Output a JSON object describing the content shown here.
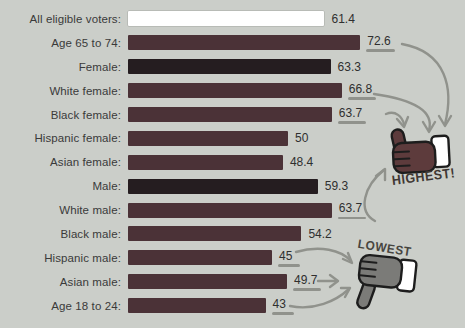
{
  "chart_data": {
    "type": "bar",
    "orientation": "horizontal",
    "title": "",
    "xlabel": "",
    "ylabel": "",
    "xlim": [
      0,
      80
    ],
    "grid": false,
    "categories": [
      "All eligible voters:",
      "Age 65 to 74:",
      "Female:",
      "White female:",
      "Black female:",
      "Hispanic female:",
      "Asian female:",
      "Male:",
      "White male:",
      "Black male:",
      "Hispanic male:",
      "Asian male:",
      "Age 18 to 24:"
    ],
    "values": [
      61.4,
      72.6,
      63.3,
      66.8,
      63.7,
      50,
      48.4,
      59.3,
      63.7,
      54.2,
      45,
      49.7,
      43
    ],
    "rows": [
      {
        "label": "All eligible voters:",
        "value": 61.4,
        "variant": "white",
        "underlined": false
      },
      {
        "label": "Age 65 to 74:",
        "value": 72.6,
        "variant": "maroon",
        "underlined": true
      },
      {
        "label": "Female:",
        "value": 63.3,
        "variant": "dark",
        "underlined": false
      },
      {
        "label": "White female:",
        "value": 66.8,
        "variant": "maroon",
        "underlined": true
      },
      {
        "label": "Black female:",
        "value": 63.7,
        "variant": "maroon",
        "underlined": true
      },
      {
        "label": "Hispanic female:",
        "value": 50,
        "variant": "maroon",
        "underlined": false
      },
      {
        "label": "Asian female:",
        "value": 48.4,
        "variant": "maroon",
        "underlined": false
      },
      {
        "label": "Male:",
        "value": 59.3,
        "variant": "dark",
        "underlined": false
      },
      {
        "label": "White male:",
        "value": 63.7,
        "variant": "maroon",
        "underlined": true
      },
      {
        "label": "Black male:",
        "value": 54.2,
        "variant": "maroon",
        "underlined": false
      },
      {
        "label": "Hispanic male:",
        "value": 45,
        "variant": "maroon",
        "underlined": true
      },
      {
        "label": "Asian male:",
        "value": 49.7,
        "variant": "maroon",
        "underlined": true
      },
      {
        "label": "Age 18 to 24:",
        "value": 43,
        "variant": "maroon",
        "underlined": true
      }
    ],
    "annotations": {
      "highest": {
        "label": "HIGHEST!",
        "icon": "thumbs-up-icon",
        "target_values": [
          72.6,
          66.8,
          63.7,
          63.7
        ]
      },
      "lowest": {
        "label": "LOWEST",
        "icon": "thumbs-down-icon",
        "target_values": [
          45,
          49.7,
          43
        ]
      }
    },
    "layout": {
      "px_per_unit": 3.2,
      "legend": "none"
    }
  },
  "colors": {
    "background": "#cbcec9",
    "bar_maroon": "#4b3237",
    "bar_dark": "#251d20",
    "bar_white": "#ffffff",
    "hand_up": "#5d3b3c",
    "hand_down": "#7b7b78",
    "outline": "#1d1d1d",
    "arrow_gray": "#90928c",
    "label_text": "#3a3a3a"
  }
}
